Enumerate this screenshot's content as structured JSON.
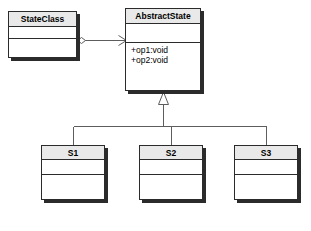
{
  "diagram": {
    "kind": "uml-class-diagram",
    "background_color": "#ffffff",
    "line_color": "#5d5d5d",
    "border_color": "#2b2b2b",
    "title_fill": "#e9e9e9",
    "compartment_fill": "#ffffff"
  },
  "classes": {
    "state_class": {
      "name": "StateClass",
      "attributes": [],
      "operations": []
    },
    "abstract_state": {
      "name": "AbstractState",
      "attributes": [],
      "operations": [
        "+op1:void",
        "+op2:void"
      ],
      "operation_1": "+op1:void",
      "operation_2": "+op2:void"
    },
    "s1": {
      "name": "S1",
      "attributes": [],
      "operations": []
    },
    "s2": {
      "name": "S2",
      "attributes": [],
      "operations": []
    },
    "s3": {
      "name": "S3",
      "attributes": [],
      "operations": []
    }
  },
  "relationships": [
    {
      "type": "aggregation",
      "source": "StateClass",
      "target": "AbstractState",
      "source_decoration": "open-diamond",
      "target_decoration": "open-arrow"
    },
    {
      "type": "generalization",
      "source": "S1",
      "target": "AbstractState",
      "target_decoration": "hollow-triangle"
    },
    {
      "type": "generalization",
      "source": "S2",
      "target": "AbstractState",
      "target_decoration": "hollow-triangle"
    },
    {
      "type": "generalization",
      "source": "S3",
      "target": "AbstractState",
      "target_decoration": "hollow-triangle"
    }
  ],
  "caption": {
    "text": ""
  }
}
